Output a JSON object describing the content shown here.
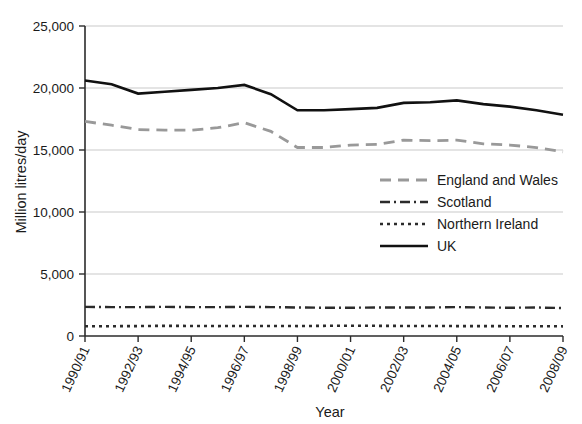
{
  "chart_data": {
    "type": "line",
    "title": "",
    "xlabel": "Year",
    "ylabel": "Million litres/day",
    "ylim": [
      0,
      25000
    ],
    "grid": true,
    "legend_position": "center-right",
    "x": [
      "1990/91",
      "1991/92",
      "1992/93",
      "1993/94",
      "1994/95",
      "1995/96",
      "1996/97",
      "1997/98",
      "1998/99",
      "1999/00",
      "2000/01",
      "2001/02",
      "2002/03",
      "2003/04",
      "2004/05",
      "2005/06",
      "2006/07",
      "2007/08",
      "2008/09"
    ],
    "x_tick_labels": [
      "1990/91",
      "1992/93",
      "1994/95",
      "1996/97",
      "1998/99",
      "2000/01",
      "2002/03",
      "2004/05",
      "2006/07",
      "2008/09"
    ],
    "y_tick_labels": [
      "0",
      "5,000",
      "10,000",
      "15,000",
      "20,000",
      "25,000"
    ],
    "y_ticks": [
      0,
      5000,
      10000,
      15000,
      20000,
      25000
    ],
    "series": [
      {
        "name": "England and Wales",
        "color": "#999999",
        "style": "dashed",
        "values": [
          17300,
          17000,
          16650,
          16600,
          16600,
          16800,
          17200,
          16500,
          15200,
          15200,
          15400,
          15450,
          15800,
          15750,
          15800,
          15500,
          15400,
          15200,
          14850
        ]
      },
      {
        "name": "Scotland",
        "color": "#2b2b2b",
        "style": "dashdot",
        "values": [
          2350,
          2330,
          2330,
          2350,
          2330,
          2330,
          2350,
          2330,
          2300,
          2280,
          2280,
          2300,
          2300,
          2300,
          2330,
          2300,
          2280,
          2300,
          2250
        ]
      },
      {
        "name": "Northern Ireland",
        "color": "#2b2b2b",
        "style": "dotted",
        "values": [
          790,
          790,
          800,
          820,
          810,
          800,
          810,
          810,
          800,
          820,
          830,
          820,
          810,
          810,
          800,
          800,
          790,
          790,
          780
        ]
      },
      {
        "name": "UK",
        "color": "#111111",
        "style": "solid",
        "values": [
          20600,
          20300,
          19550,
          19700,
          19850,
          20000,
          20250,
          19500,
          18200,
          18200,
          18300,
          18400,
          18800,
          18850,
          19000,
          18700,
          18500,
          18200,
          17850
        ]
      }
    ]
  },
  "legend": {
    "items": [
      {
        "label": "England and Wales"
      },
      {
        "label": "Scotland"
      },
      {
        "label": "Northern Ireland"
      },
      {
        "label": "UK"
      }
    ]
  },
  "axes": {
    "y_title": "Million litres/day",
    "x_title": "Year"
  }
}
